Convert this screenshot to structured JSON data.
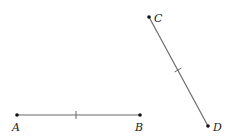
{
  "diagram": {
    "colors": {
      "line": "#6b6b6b",
      "point": "#111111",
      "label": "#222222"
    },
    "points": [
      {
        "name": "A",
        "x": 17,
        "y": 115,
        "label_x": 12,
        "label_y": 131
      },
      {
        "name": "B",
        "x": 140,
        "y": 115,
        "label_x": 135,
        "label_y": 131
      },
      {
        "name": "C",
        "x": 149,
        "y": 17,
        "label_x": 154,
        "label_y": 22
      },
      {
        "name": "D",
        "x": 208,
        "y": 126,
        "label_x": 213,
        "label_y": 131
      }
    ],
    "segments": [
      {
        "from": "A",
        "to": "B",
        "tick_marks": 1
      },
      {
        "from": "C",
        "to": "D",
        "tick_marks": 1
      }
    ]
  }
}
